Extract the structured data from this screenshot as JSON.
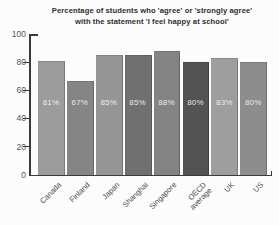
{
  "title": {
    "line1": "Percentage of students who 'agree' or 'strongly agree'",
    "line2": "with the statement 'I feel happy at school'"
  },
  "chart_data": {
    "type": "bar",
    "title": "Percentage of students who 'agree' or 'strongly agree' with the statement 'I feel happy at school'",
    "categories": [
      "Canada",
      "Finland",
      "Japan",
      "Shanghai",
      "Singapore",
      "OECD average",
      "UK",
      "US"
    ],
    "values": [
      81,
      67,
      85,
      85,
      88,
      80,
      83,
      80
    ],
    "bar_labels": [
      "81%",
      "67%",
      "85%",
      "85%",
      "88%",
      "80%",
      "83%",
      "80%"
    ],
    "bar_colors": [
      "#9c9c9c",
      "#858585",
      "#959595",
      "#707070",
      "#838383",
      "#535353",
      "#9e9e9e",
      "#8d8d8d"
    ],
    "xlabel": "",
    "ylabel": "",
    "ylim": [
      0,
      100
    ],
    "yticks": [
      100,
      80,
      60,
      40,
      20,
      0
    ],
    "grid": false,
    "legend": "none"
  },
  "colors": {
    "axis": "#3a3a3a",
    "tick_label": "#565656",
    "bar_value_text": "#f5f5f5",
    "category_label": "#4a4a4a",
    "title_text": "#2e2e2e",
    "background": "#fcfcfc"
  }
}
